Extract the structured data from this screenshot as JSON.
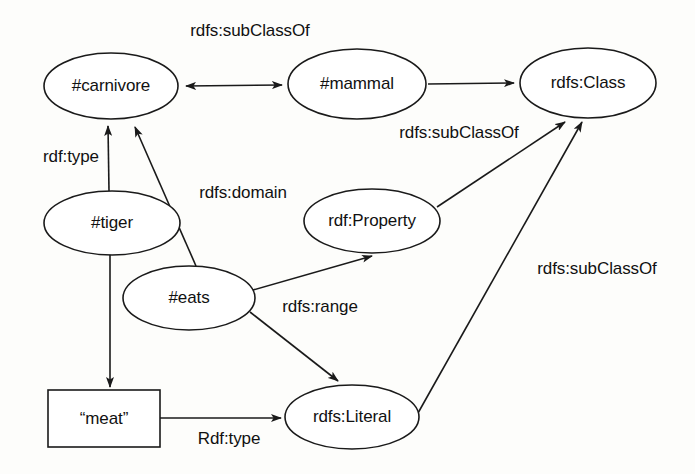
{
  "diagram": {
    "colors": {
      "background": "#fdfdfb",
      "stroke": "#1a1a1a",
      "node_fill": "#ffffff",
      "text": "#111111"
    },
    "nodes": [
      {
        "id": "carnivore",
        "label": "#carnivore",
        "shape": "ellipse",
        "cx": 111,
        "cy": 86,
        "rx": 67,
        "ry": 33
      },
      {
        "id": "mammal",
        "label": "#mammal",
        "shape": "ellipse",
        "cx": 357,
        "cy": 84,
        "rx": 69,
        "ry": 35
      },
      {
        "id": "rdfsclass",
        "label": "rdfs:Class",
        "shape": "ellipse",
        "cx": 588,
        "cy": 83,
        "rx": 68,
        "ry": 35
      },
      {
        "id": "tiger",
        "label": "#tiger",
        "shape": "ellipse",
        "cx": 112,
        "cy": 223,
        "rx": 68,
        "ry": 32
      },
      {
        "id": "rdfproperty",
        "label": "rdf:Property",
        "shape": "ellipse",
        "cx": 372,
        "cy": 221,
        "rx": 68,
        "ry": 32
      },
      {
        "id": "eats",
        "label": "#eats",
        "shape": "ellipse",
        "cx": 189,
        "cy": 298,
        "rx": 66,
        "ry": 32
      },
      {
        "id": "meat",
        "label": "“meat”",
        "shape": "rect",
        "cx": 104,
        "cy": 419,
        "w": 112,
        "h": 57
      },
      {
        "id": "rdfsliteral",
        "label": "rdfs:Literal",
        "shape": "ellipse",
        "cx": 352,
        "cy": 417,
        "rx": 67,
        "ry": 32
      }
    ],
    "edges": [
      {
        "id": "e1",
        "from": "carnivore",
        "to": "mammal",
        "label": "rdfs:subClassOf",
        "label_x": 250,
        "label_y": 31,
        "arrows": "both"
      },
      {
        "id": "e2",
        "from": "mammal",
        "to": "rdfsclass",
        "label": "rdfs:subClassOf",
        "label_x": 459,
        "label_y": 133,
        "arrows": "end"
      },
      {
        "id": "e3",
        "from": "tiger",
        "to": "carnivore",
        "label": "rdf:type",
        "label_x": 71,
        "label_y": 157,
        "arrows": "end"
      },
      {
        "id": "e4",
        "from": "eats",
        "to": "carnivore",
        "label": "rdfs:domain",
        "label_x": 243,
        "label_y": 193,
        "arrows": "end"
      },
      {
        "id": "e5",
        "from": "rdfproperty",
        "to": "rdfsclass",
        "label": "",
        "label_x": 0,
        "label_y": 0,
        "arrows": "end"
      },
      {
        "id": "e6",
        "from": "eats",
        "to": "rdfproperty",
        "label": "",
        "label_x": 0,
        "label_y": 0,
        "arrows": "end"
      },
      {
        "id": "e7",
        "from": "eats",
        "to": "rdfsliteral",
        "label": "rdfs:range",
        "label_x": 320,
        "label_y": 307,
        "arrows": "end"
      },
      {
        "id": "e8",
        "from": "tiger",
        "to": "meat",
        "label": "",
        "label_x": 0,
        "label_y": 0,
        "arrows": "end"
      },
      {
        "id": "e9",
        "from": "meat",
        "to": "rdfsliteral",
        "label": "Rdf:type",
        "label_x": 229,
        "label_y": 439,
        "arrows": "end"
      },
      {
        "id": "e10",
        "from": "rdfsliteral",
        "to": "rdfsclass",
        "label": "rdfs:subClassOf",
        "label_x": 597,
        "label_y": 269,
        "arrows": "end"
      }
    ]
  }
}
